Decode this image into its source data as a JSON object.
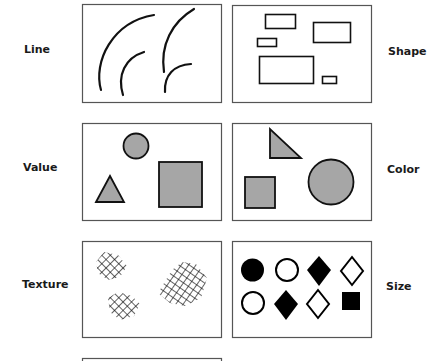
{
  "diagram": {
    "panels": [
      {
        "id": "line",
        "label": "Line",
        "side": "left"
      },
      {
        "id": "shape",
        "label": "Shape",
        "side": "right"
      },
      {
        "id": "value",
        "label": "Value",
        "side": "left"
      },
      {
        "id": "color",
        "label": "Color",
        "side": "right"
      },
      {
        "id": "texture",
        "label": "Texture",
        "side": "left"
      },
      {
        "id": "size",
        "label": "Size",
        "side": "right"
      }
    ]
  },
  "labels": {
    "line": "Line",
    "shape": "Shape",
    "value": "Value",
    "color": "Color",
    "texture": "Texture",
    "size": "Size"
  },
  "colors": {
    "stroke": "#111111",
    "frame": "#555555",
    "fill_gray": "#a6a6a6",
    "fill_black": "#000000"
  },
  "size_symbols": [
    [
      "filled-circle",
      "open-circle",
      "filled-diamond",
      "open-diamond"
    ],
    [
      "open-circle",
      "filled-diamond",
      "open-diamond",
      "filled-square"
    ]
  ]
}
